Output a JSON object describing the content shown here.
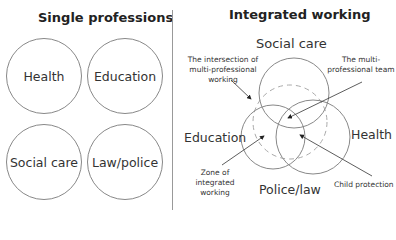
{
  "left_panel": {
    "title": "Single professions",
    "circles": [
      {
        "label": "Health"
      },
      {
        "label": "Education"
      },
      {
        "label": "Social care"
      },
      {
        "label": "Law/police"
      }
    ]
  },
  "right_panel": {
    "title": "Integrated working",
    "circle_labels": {
      "top": "Social care",
      "left": "Education",
      "right": "Health",
      "bottom": "Police/law"
    },
    "annotations": {
      "intersection_line1": "The intersection of",
      "intersection_line2": "multi-professional",
      "intersection_line3": "working",
      "team_line1": "The multi-",
      "team_line2": "professional team",
      "zone_line1": "Zone of",
      "zone_line2": "integrated",
      "zone_line3": "working",
      "child_protection": "Child protection"
    }
  },
  "colors": {
    "stroke": "#888888",
    "text": "#333333",
    "dashed": "#aaaaaa"
  }
}
